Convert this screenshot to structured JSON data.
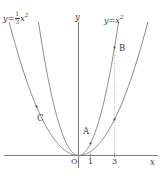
{
  "figure": {
    "background_color": "#ffffff",
    "ink_color": "#3a3a3a",
    "width": 163,
    "height": 176
  },
  "axes": {
    "x_label": "x",
    "y_label": "y",
    "origin_label": "O",
    "x_ticks": [
      {
        "label": "1",
        "value": 1
      },
      {
        "label": "3",
        "value": 3
      }
    ]
  },
  "curve_labels": {
    "left": {
      "lhs": "y",
      "equals": "=",
      "fraction_numerator": "1",
      "fraction_denominator": "3",
      "variable": "x",
      "exponent": "2"
    },
    "right": {
      "lhs": "y",
      "equals": "=",
      "variable": "x",
      "exponent": "2"
    }
  },
  "points": [
    {
      "name": "A",
      "label": "A",
      "x": 1,
      "y": 1,
      "on_curve": "y = x^2"
    },
    {
      "name": "B",
      "label": "B",
      "x": 3,
      "y": 9,
      "on_curve": "y = x^2"
    },
    {
      "name": "C",
      "label": "C",
      "x": -3.5,
      "y": 4.08,
      "on_curve": "y = (1/3)x^2"
    },
    {
      "name": "D",
      "label": "",
      "x": 3,
      "y": 3,
      "on_curve": "y = (1/3)x^2"
    }
  ],
  "chart_data": {
    "type": "line",
    "title": "",
    "xlabel": "x",
    "ylabel": "y",
    "grid": false,
    "legend": "inline-curve-labels",
    "xlim": [
      -6.9,
      7.2
    ],
    "ylim": [
      -1.3,
      11.2
    ],
    "annotations": [
      {
        "text": "A",
        "x": 1,
        "y": 1
      },
      {
        "text": "B",
        "x": 3,
        "y": 9
      },
      {
        "text": "C",
        "x": -3.5,
        "y": 4.08
      },
      {
        "text": "O",
        "x": 0,
        "y": 0
      }
    ],
    "guide_lines": [
      {
        "type": "vertical-dotted",
        "x": 3,
        "y_from": 0,
        "y_to": 9
      }
    ],
    "series": [
      {
        "name": "y = x^2",
        "equation": "y = x^2",
        "coefficient": 1,
        "x": [
          -3.35,
          -3.0,
          -2.5,
          -2.0,
          -1.5,
          -1.0,
          -0.5,
          0,
          0.5,
          1.0,
          1.5,
          2.0,
          2.5,
          3.0,
          3.35
        ],
        "values": [
          11.2,
          9.0,
          6.25,
          4.0,
          2.25,
          1.0,
          0.25,
          0,
          0.25,
          1.0,
          2.25,
          4.0,
          6.25,
          9.0,
          11.2
        ]
      },
      {
        "name": "y = (1/3)x^2",
        "equation": "y = (1/3)x^2",
        "coefficient": 0.3333,
        "x": [
          -5.8,
          -5.0,
          -4.0,
          -3.5,
          -3.0,
          -2.0,
          -1.0,
          0,
          1.0,
          2.0,
          3.0,
          4.0,
          5.0,
          5.8
        ],
        "values": [
          11.2,
          8.33,
          5.33,
          4.08,
          3.0,
          1.33,
          0.33,
          0,
          0.33,
          1.33,
          3.0,
          5.33,
          8.33,
          11.2
        ]
      }
    ]
  }
}
